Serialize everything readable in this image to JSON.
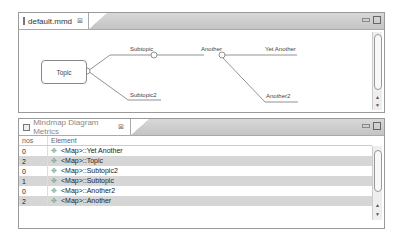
{
  "editor": {
    "tab_label": "default.mmd",
    "tab_icon": "file-icon",
    "close_glyph": "⊠",
    "diagram": {
      "root": "Topic",
      "nodes": {
        "subtopic": "Subtopic",
        "subtopic2": "Subtopic2",
        "another": "Another",
        "yet_another": "Yet Another",
        "another2": "Another2"
      }
    }
  },
  "metrics": {
    "tab_label": "Mindmap Diagram Metrics",
    "tab_icon": "view-icon",
    "close_glyph": "⊠",
    "columns": [
      "nos",
      "Element"
    ],
    "rows": [
      {
        "nos": "0",
        "element": "<Map>::Yet Another"
      },
      {
        "nos": "2",
        "element": "<Map>::Topic"
      },
      {
        "nos": "0",
        "element": "<Map>::Subtopic2"
      },
      {
        "nos": "1",
        "element": "<Map>::Subtopic"
      },
      {
        "nos": "0",
        "element": "<Map>::Another2"
      },
      {
        "nos": "2",
        "element": "<Map>::Another"
      }
    ],
    "row_icon": "✥"
  },
  "scroll": {
    "up": "▲",
    "down": "▼"
  }
}
